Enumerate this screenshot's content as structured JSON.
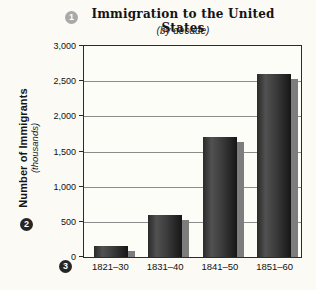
{
  "markers": {
    "one": "1",
    "two": "2",
    "three": "3"
  },
  "header": {
    "title": "Immigration to the United States",
    "subtitle": "(by decade)"
  },
  "y_axis": {
    "title": "Number of Immigrants",
    "subtitle": "(thousands)",
    "ticks": [
      "3,000",
      "2,500",
      "2,000",
      "1,500",
      "1,000",
      "500",
      "0"
    ]
  },
  "x_axis": {
    "categories": [
      "1821–30",
      "1831–40",
      "1841–50",
      "1851–60"
    ]
  },
  "colors": {
    "background": "#fbfaf4",
    "plot_border": "#2b2b2b",
    "gridline": "#8c8c8c",
    "bar_dark": "#161616",
    "bar_light": "#515151",
    "bar_shadow": "#7d7d7d",
    "marker_gray": "#a9a9a9",
    "marker_black": "#262626"
  },
  "chart_data": {
    "type": "bar",
    "title": "Immigration to the United States",
    "subtitle": "(by decade)",
    "categories": [
      "1821–30",
      "1831–40",
      "1841–50",
      "1851–60"
    ],
    "values": [
      150,
      600,
      1700,
      2600
    ],
    "xlabel": "",
    "ylabel": "Number of Immigrants (thousands)",
    "ylim": [
      0,
      3000
    ],
    "ytick_step": 500,
    "grid": true,
    "legend": false
  }
}
